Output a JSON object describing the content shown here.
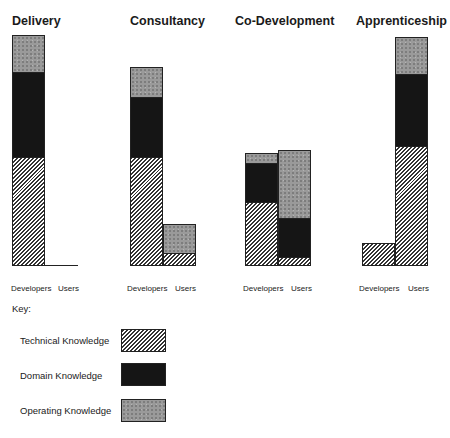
{
  "chart_data": {
    "type": "bar",
    "stacked": true,
    "title": "",
    "xlabel": "",
    "ylabel": "",
    "ylim": [
      0,
      100
    ],
    "grid": false,
    "legend_position": "bottom-left",
    "legend_title": "Key:",
    "stack_order_bottom_to_top": [
      "Technical Knowledge",
      "Domain Knowledge",
      "Operating Knowledge"
    ],
    "panels": [
      {
        "title": "Delivery",
        "categories": [
          "Developers",
          "Users"
        ],
        "series": [
          {
            "name": "Technical Knowledge",
            "values": [
              47,
              0
            ]
          },
          {
            "name": "Domain Knowledge",
            "values": [
              37,
              0
            ]
          },
          {
            "name": "Operating Knowledge",
            "values": [
              16,
              0
            ]
          }
        ]
      },
      {
        "title": "Consultancy",
        "categories": [
          "Developers",
          "Users"
        ],
        "series": [
          {
            "name": "Technical Knowledge",
            "values": [
              47,
              5
            ]
          },
          {
            "name": "Domain Knowledge",
            "values": [
              26,
              0
            ]
          },
          {
            "name": "Operating Knowledge",
            "values": [
              13,
              13
            ]
          }
        ]
      },
      {
        "title": "Co-Development",
        "categories": [
          "Developers",
          "Users"
        ],
        "series": [
          {
            "name": "Technical Knowledge",
            "values": [
              28,
              3
            ]
          },
          {
            "name": "Domain Knowledge",
            "values": [
              17,
              17
            ]
          },
          {
            "name": "Operating Knowledge",
            "values": [
              4,
              30
            ]
          }
        ]
      },
      {
        "title": "Apprenticeship",
        "categories": [
          "Developers",
          "Users"
        ],
        "series": [
          {
            "name": "Technical Knowledge",
            "values": [
              10,
              52
            ]
          },
          {
            "name": "Domain Knowledge",
            "values": [
              0,
              31
            ]
          },
          {
            "name": "Operating Knowledge",
            "values": [
              0,
              16
            ]
          }
        ]
      }
    ]
  },
  "titles": [
    "Delivery",
    "Consultancy",
    "Co-Development",
    "Apprenticeship"
  ],
  "axis_labels": {
    "developers": "Developers",
    "users": "Users"
  },
  "legend": {
    "title": "Key:",
    "items": [
      {
        "label": "Technical Knowledge",
        "pattern": "diagonal-hatch"
      },
      {
        "label": "Domain Knowledge",
        "pattern": "solid-black",
        "color": "#151515"
      },
      {
        "label": "Operating Knowledge",
        "pattern": "stipple-gray",
        "color": "#9a9a9a"
      }
    ]
  }
}
